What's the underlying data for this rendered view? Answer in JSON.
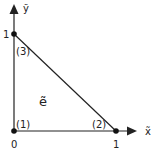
{
  "diagram": {
    "type": "reference-triangle-element",
    "element_label": "ẽ",
    "axes": {
      "x_label": "x̃",
      "y_label": "ỹ"
    },
    "ticks": {
      "origin": "0",
      "x_one": "1",
      "y_one": "1"
    },
    "nodes": [
      {
        "id": "(1)",
        "x": 0,
        "y": 0
      },
      {
        "id": "(2)",
        "x": 1,
        "y": 0
      },
      {
        "id": "(3)",
        "x": 0,
        "y": 1
      }
    ],
    "colors": {
      "line": "#222222",
      "background": "#ffffff"
    }
  }
}
